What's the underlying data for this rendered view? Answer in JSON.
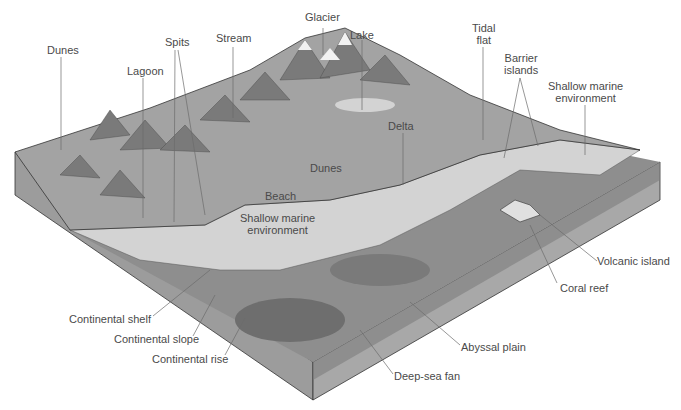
{
  "diagram": {
    "colors": {
      "land": "#a6a6a6",
      "shallow_water": "#d2d2d2",
      "slope": "#8f8f8f",
      "deep": "#7a7a7a",
      "block_side": "#9a9a9a",
      "leader_line": "#6b6b6b",
      "text": "#4a4a4a"
    },
    "labels": {
      "glacier": "Glacier",
      "lake": "Lake",
      "dunes_land": "Dunes",
      "spits": "Spits",
      "stream": "Stream",
      "lagoon": "Lagoon",
      "tidal_flat_1": "Tidal",
      "tidal_flat_2": "flat",
      "barrier_islands_1": "Barrier",
      "barrier_islands_2": "islands",
      "shallow_marine_right_1": "Shallow marine",
      "shallow_marine_right_2": "environment",
      "delta": "Delta",
      "dunes_coast": "Dunes",
      "beach": "Beach",
      "shallow_marine_center_1": "Shallow marine",
      "shallow_marine_center_2": "environment",
      "volcanic_island": "Volcanic island",
      "coral_reef": "Coral reef",
      "continental_shelf": "Continental shelf",
      "continental_slope": "Continental slope",
      "continental_rise": "Continental rise",
      "abyssal_plain": "Abyssal plain",
      "deep_sea_fan": "Deep-sea fan"
    }
  }
}
